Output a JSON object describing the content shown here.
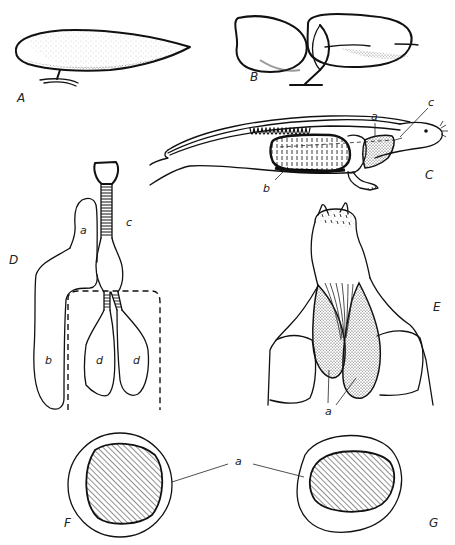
{
  "figure": {
    "panels": [
      {
        "id": "A",
        "label": "A",
        "description": "elongated teardrop-shaped organ on stalk"
      },
      {
        "id": "B",
        "label": "B",
        "description": "two-lobed organ on stalk"
      },
      {
        "id": "C",
        "label": "C",
        "description": "side view of animal body with internal organs",
        "parts": [
          "a",
          "b",
          "c"
        ]
      },
      {
        "id": "D",
        "label": "D",
        "description": "tracheal tube with sacs",
        "parts": [
          "a",
          "b",
          "c",
          "d",
          "d"
        ]
      },
      {
        "id": "E",
        "label": "E",
        "description": "ventral view of paired stippled sacs",
        "parts": [
          "a"
        ]
      },
      {
        "id": "F",
        "label": "F",
        "description": "circular cross-section with hatched core"
      },
      {
        "id": "G",
        "label": "G",
        "description": "oval cross-section with hatched core"
      }
    ],
    "labels": {
      "A": "A",
      "B": "B",
      "C": "C",
      "C_a": "a",
      "C_b": "b",
      "C_c": "c",
      "D": "D",
      "D_a": "a",
      "D_b": "b",
      "D_c": "c",
      "D_d1": "d",
      "D_d2": "d",
      "E": "E",
      "E_a": "a",
      "FG_a": "a",
      "F": "F",
      "G": "G"
    }
  },
  "colors": {
    "ink": "#111111",
    "hatch": "#333333",
    "background": "#ffffff"
  }
}
